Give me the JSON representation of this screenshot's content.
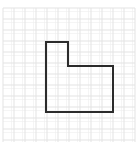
{
  "figure": {
    "background_color": "#ffffff",
    "canvas": {
      "width": 140,
      "height": 152
    },
    "grid": {
      "type": "graph-paper",
      "minor_spacing_px": 11,
      "minor_color": "#ececec",
      "major_color": "#e0e0e0",
      "major_every": 1,
      "area": {
        "x": 3,
        "y": 8,
        "width": 132,
        "height": 134
      },
      "columns": 12,
      "rows": 12,
      "visible": true
    },
    "shape": {
      "name": "L-shape",
      "kind": "polygon",
      "stroke_color": "#2b2b2b",
      "stroke_width_px": 2,
      "fill": "none",
      "vertices": [
        {
          "label": "top-left",
          "x": 46,
          "y": 42
        },
        {
          "label": "top-right-of-arm",
          "x": 68,
          "y": 42
        },
        {
          "label": "inner-notch-corner",
          "x": 68,
          "y": 66
        },
        {
          "label": "right-top",
          "x": 113,
          "y": 66
        },
        {
          "label": "bottom-right",
          "x": 113,
          "y": 112
        },
        {
          "label": "bottom-left",
          "x": 46,
          "y": 112
        }
      ],
      "points_attr": "46,42 68,42 68,66 113,66 113,112 46,112 46,42",
      "grid_units": {
        "arm_width": 2,
        "arm_height": 2,
        "base_width": 6,
        "base_height": 4
      }
    }
  }
}
